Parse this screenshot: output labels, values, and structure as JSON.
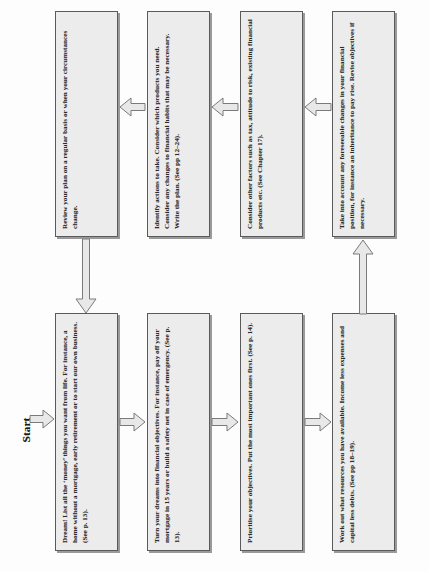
{
  "diagram": {
    "orientation": "rotated-90-ccw",
    "start_label": "Start",
    "colors": {
      "box_fill": "#ececec",
      "box_border": "#5a5a5a",
      "box_shadow": "#9a9a9a",
      "arrow_fill": "#e8e8e8",
      "arrow_stroke": "#7a7a7a",
      "text": "#2b2b2b",
      "page_background": "#fdfdfd"
    }
  },
  "nodes": {
    "bottom_row": [
      {
        "id": "dream",
        "text": "Dream! List all the ‘money’ things you want from life. For instance, a home without a mortgage, early retirement or to start our own business. (See p. 13)."
      },
      {
        "id": "objectives",
        "text": "Turn your dreams into financial objectives. For instance, pay off your mortgage in 15 years or build a safety net in case of emergency. (See p. 13)."
      },
      {
        "id": "prioritise",
        "text": "Prioritise your objectives. Put the  most important ones first. (See p. 14)."
      },
      {
        "id": "resources",
        "text": "Work out what resources you have available. Income less expenses and capital less debts. (See pp 18–19)."
      }
    ],
    "top_row": [
      {
        "id": "review",
        "text": "Review your plan on a regular basis or when your circumstances change."
      },
      {
        "id": "identify-actions",
        "text": "Identify actions to take. Consider which products you need. Consider any changes to financial  habits that may be necessary. Write the plan. (See pp 12–24)."
      },
      {
        "id": "other-factors",
        "text": "Consider other factors such as tax, attitude to risk, existing financial products etc. (See Chapter 17)."
      },
      {
        "id": "foreseeable-changes",
        "text": "Take into account any foreseeable changes in your financial position, for instance an inheritance to pay rise. Revise objectives if necessary."
      }
    ]
  },
  "connectors": [
    {
      "id": "start-to-dream",
      "direction": "right",
      "label": ""
    },
    {
      "id": "dream-to-objectives",
      "direction": "right",
      "label": ""
    },
    {
      "id": "objectives-to-prioritise",
      "direction": "right",
      "label": ""
    },
    {
      "id": "prioritise-to-resources",
      "direction": "right",
      "label": ""
    },
    {
      "id": "resources-to-foreseeable",
      "direction": "up",
      "label": ""
    },
    {
      "id": "foreseeable-to-other-factors",
      "direction": "left",
      "label": ""
    },
    {
      "id": "other-factors-to-identify",
      "direction": "left",
      "label": ""
    },
    {
      "id": "identify-to-review",
      "direction": "left",
      "label": ""
    },
    {
      "id": "review-to-dream",
      "direction": "down",
      "label": ""
    }
  ]
}
